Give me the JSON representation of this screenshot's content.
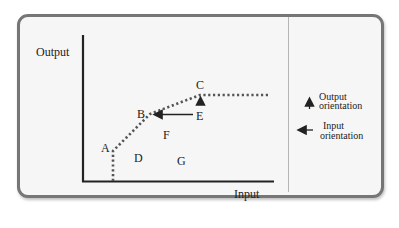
{
  "diagram": {
    "axes": {
      "y_label": "Output",
      "x_label": "Input"
    },
    "points": [
      {
        "id": "A",
        "label": "A",
        "x": 113,
        "y": 150
      },
      {
        "id": "B",
        "label": "B",
        "x": 150,
        "y": 114
      },
      {
        "id": "C",
        "label": "C",
        "x": 200,
        "y": 95
      },
      {
        "id": "D",
        "label": "D",
        "x": 138,
        "y": 157
      },
      {
        "id": "E",
        "label": "E",
        "x": 200,
        "y": 115
      },
      {
        "id": "F",
        "label": "F",
        "x": 166,
        "y": 135
      },
      {
        "id": "G",
        "label": "G",
        "x": 181,
        "y": 160
      }
    ],
    "frontier": "dotted piecewise frontier from x-axis up through A, B, C then flat",
    "arrows": [
      {
        "from": "E",
        "to": "B",
        "direction": "left"
      },
      {
        "from": "E",
        "to": "C",
        "direction": "up"
      }
    ],
    "legend": {
      "output": {
        "line1": "Output",
        "line2": "orientation"
      },
      "input": {
        "line1": "Input",
        "line2": "orientation"
      }
    },
    "colors": {
      "border": "#767676",
      "background": "#f6f6f6",
      "ink": "#222222",
      "frontier": "#555555"
    }
  }
}
